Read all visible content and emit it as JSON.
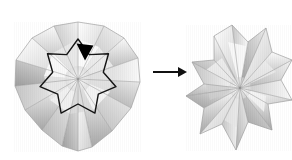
{
  "figure": {
    "background_color": "#ffffff",
    "width": 292,
    "height": 160,
    "step_relation": "before-after",
    "caption": ""
  },
  "arrow": {
    "name": "process-arrow",
    "direction": "right",
    "color": "#111111",
    "x_start": 153,
    "x_end": 187,
    "y": 72,
    "shaft_width": 2,
    "head_length": 9,
    "head_width": 10
  },
  "left_model": {
    "label": "Folded paper dome before collapse",
    "center": [
      78,
      79
    ],
    "bounds": [
      14,
      22,
      140,
      151
    ],
    "facet_count": 16,
    "silhouette": "rounded polygon / dome",
    "paper_tone_light": "#fdfdfd",
    "paper_tone_mid": "#d8d8d8",
    "paper_tone_dark": "#9a9a9a",
    "outline": {
      "name": "star-crease-outline",
      "shape": "seven-pointed star",
      "stroke_color": "#141414",
      "stroke_width": 1.4,
      "points": 7,
      "center": [
        78,
        78
      ],
      "outer_radius": 39,
      "inner_radius": 26
    },
    "push_marker": {
      "name": "push-here-arrow",
      "shape": "solid downward triangle",
      "color": "#000000",
      "x": 85,
      "y": 52,
      "width": 17,
      "height": 17
    },
    "silhouette_points": "78,22 104,26 124,38 138,58 140,82 131,108 112,131 92,147 78,151 62,146 42,130 25,110 15,86 16,60 32,38 54,26"
  },
  "right_model": {
    "label": "Collapsed star form after fold",
    "center": [
      240,
      88
    ],
    "bounds": [
      192,
      25,
      292,
      150
    ],
    "facet_count": 18,
    "silhouette": "multi-pointed star",
    "paper_tone_light": "#fcfcfc",
    "paper_tone_mid": "#d2d2d2",
    "paper_tone_dark": "#909090",
    "silhouette_points": "232,25 248,42 266,28 272,52 292,60 281,80 292,100 268,104 272,130 248,122 236,150 222,124 200,134 204,108 186,96 204,84 192,62 214,60 214,36"
  }
}
